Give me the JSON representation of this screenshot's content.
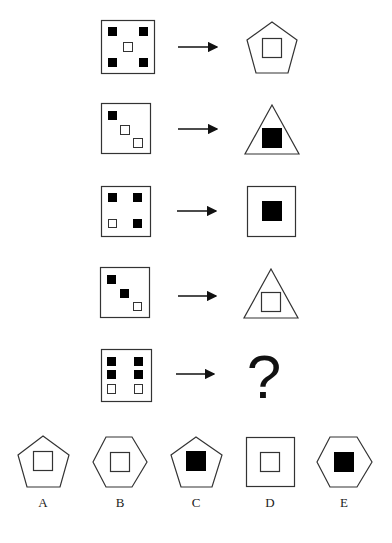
{
  "puzzle": {
    "type": "figure-matrix",
    "question_mark": "?",
    "rows": [
      {
        "left": {
          "frame": "square",
          "dots": [
            {
              "fill": "black"
            },
            {
              "fill": "black"
            },
            {
              "fill": "white"
            },
            {
              "fill": "black"
            },
            {
              "fill": "black"
            }
          ],
          "layout": "quincunx-center-white"
        },
        "right": {
          "shape": "pentagon",
          "inner_square": "white"
        }
      },
      {
        "left": {
          "frame": "square",
          "dots": [
            {
              "fill": "black"
            },
            {
              "fill": "white"
            },
            {
              "fill": "white"
            }
          ],
          "layout": "diagonal"
        },
        "right": {
          "shape": "triangle",
          "inner_square": "black"
        }
      },
      {
        "left": {
          "frame": "square",
          "dots": [
            {
              "fill": "black"
            },
            {
              "fill": "black"
            },
            {
              "fill": "white"
            },
            {
              "fill": "black"
            }
          ],
          "layout": "four-corners"
        },
        "right": {
          "shape": "square",
          "inner_square": "black"
        }
      },
      {
        "left": {
          "frame": "square",
          "dots": [
            {
              "fill": "black"
            },
            {
              "fill": "black"
            },
            {
              "fill": "white"
            }
          ],
          "layout": "diagonal"
        },
        "right": {
          "shape": "triangle",
          "inner_square": "white"
        }
      },
      {
        "left": {
          "frame": "square",
          "dots": [
            {
              "fill": "black"
            },
            {
              "fill": "black"
            },
            {
              "fill": "black"
            },
            {
              "fill": "black"
            },
            {
              "fill": "white"
            },
            {
              "fill": "white"
            }
          ],
          "layout": "two-columns-of-three"
        },
        "right": {
          "shape": "unknown",
          "text": "?"
        }
      }
    ],
    "options": [
      {
        "label": "A",
        "shape": "pentagon",
        "inner_square": "white"
      },
      {
        "label": "B",
        "shape": "hexagon",
        "inner_square": "white"
      },
      {
        "label": "C",
        "shape": "pentagon",
        "inner_square": "black"
      },
      {
        "label": "D",
        "shape": "square",
        "inner_square": "white"
      },
      {
        "label": "E",
        "shape": "hexagon",
        "inner_square": "black"
      }
    ]
  },
  "colors": {
    "stroke": "#333333",
    "fill_black": "#000000",
    "background": "#ffffff"
  }
}
